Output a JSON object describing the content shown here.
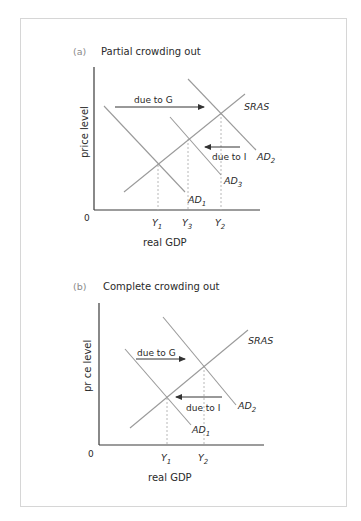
{
  "figure": {
    "panels": [
      {
        "id": "a",
        "tag": "(a)",
        "title": "Partial crowding out",
        "y_axis_label": "price level",
        "x_axis_label": "real GDP",
        "origin_label": "0",
        "curves": [
          {
            "name": "AD",
            "subscript": "1"
          },
          {
            "name": "AD",
            "subscript": "3"
          },
          {
            "name": "AD",
            "subscript": "2"
          },
          {
            "name": "SRAS",
            "subscript": ""
          }
        ],
        "x_ticks": [
          {
            "name": "Y",
            "subscript": "1"
          },
          {
            "name": "Y",
            "subscript": "3"
          },
          {
            "name": "Y",
            "subscript": "2"
          }
        ],
        "arrows": [
          {
            "label": "due to G",
            "direction": "right"
          },
          {
            "label": "due to I",
            "direction": "left"
          }
        ]
      },
      {
        "id": "b",
        "tag": "(b)",
        "title": "Complete crowding out",
        "y_axis_label": "pr ce level",
        "x_axis_label": "real GDP",
        "origin_label": "0",
        "curves": [
          {
            "name": "AD",
            "subscript": "1"
          },
          {
            "name": "AD",
            "subscript": "2"
          },
          {
            "name": "SRAS",
            "subscript": ""
          }
        ],
        "x_ticks": [
          {
            "name": "Y",
            "subscript": "1"
          },
          {
            "name": "Y",
            "subscript": "2"
          }
        ],
        "arrows": [
          {
            "label": "due to G",
            "direction": "right"
          },
          {
            "label": "due to I",
            "direction": "left"
          }
        ]
      }
    ],
    "colors": {
      "curve": "#9a9a9a",
      "axis": "#3a3a3a",
      "arrow": "#333333",
      "dashed": "#b0b0b0",
      "frame": "#d6d6d6"
    }
  }
}
